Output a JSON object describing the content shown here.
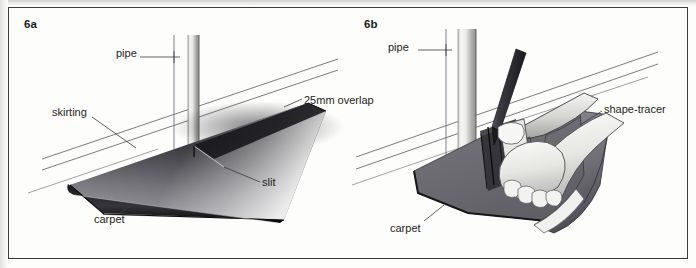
{
  "plate": {
    "title": "Fitting carpet around a pipe",
    "panel_count": 2,
    "frame_color": "#3b3b3f",
    "paper_color": "#fdfdfc",
    "ink_color": "#1d1d21"
  },
  "panels": [
    {
      "id": "6a",
      "number": "6a",
      "caption": "Carpet slit to the pipe with a 25mm overlap against the skirting",
      "labels": [
        {
          "name": "pipe",
          "text": "pipe",
          "x": 108,
          "y": 47
        },
        {
          "name": "skirting",
          "text": "skirting",
          "x": 44,
          "y": 106
        },
        {
          "name": "overlap",
          "text": "25mm overlap",
          "x": 295,
          "y": 94
        },
        {
          "name": "slit",
          "text": "slit",
          "x": 256,
          "y": 176
        },
        {
          "name": "carpet",
          "text": "carpet",
          "x": 88,
          "y": 213
        }
      ],
      "objects": [
        "pipe",
        "skirting-board",
        "floor-line",
        "carpet-sheet",
        "slit-cut"
      ]
    },
    {
      "id": "6b",
      "number": "6b",
      "caption": "Marking the pipe position on the carpet using a shape-tracer",
      "labels": [
        {
          "name": "pipe",
          "text": "pipe",
          "x": 388,
          "y": 40
        },
        {
          "name": "shape-tracer",
          "text": "shape-tracer",
          "x": 604,
          "y": 102
        },
        {
          "name": "carpet",
          "text": "carpet",
          "x": 390,
          "y": 222
        }
      ],
      "objects": [
        "pipe",
        "skirting-board",
        "floor-line",
        "carpet-sheet",
        "shape-tracer-tool",
        "hand",
        "pencil"
      ]
    }
  ],
  "colors": {
    "carpet_dark": "#111114",
    "carpet_mid": "#6f6f73",
    "carpet_light": "#cfcfd2",
    "pipe_light": "#f2f2f0",
    "pipe_shadow": "#9a9a9a",
    "line": "#55555a",
    "leader": "#3a3a3f"
  }
}
